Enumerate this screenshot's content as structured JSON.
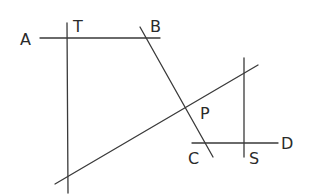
{
  "diagram": {
    "labels": {
      "A": "A",
      "T": "T",
      "B": "B",
      "P": "P",
      "C": "C",
      "S": "S",
      "D": "D"
    },
    "colors": {
      "line": "#3a3a3a",
      "text": "#2a2a2a",
      "background": "#ffffff"
    }
  }
}
